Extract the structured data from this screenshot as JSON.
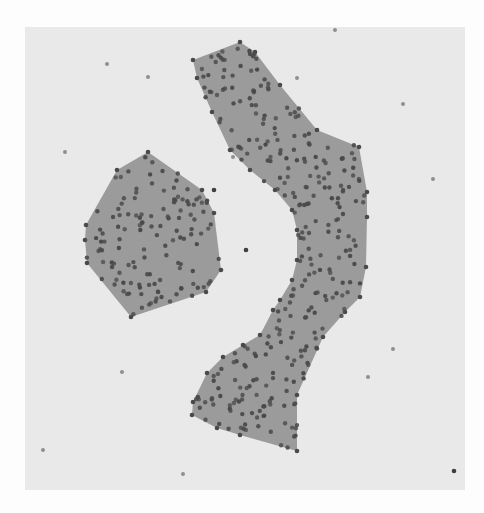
{
  "chart_data": {
    "type": "scatter",
    "title": "",
    "xlabel": "",
    "ylabel": "",
    "grid": false,
    "legend": null,
    "colors": {
      "panel_background": "#e9e9e9",
      "page_background": "#fdfdfd",
      "hull_fill": "#9b9b9b",
      "cluster_point": "#4a4a4a",
      "noise_point": "#8f8f8f",
      "dark_outlier": "#3f3f3f"
    },
    "clusters": [
      {
        "name": "cluster-1",
        "shape": "compact polygon (left)",
        "approx_point_count": 130,
        "hull": [
          [
            148,
            152
          ],
          [
            202,
            190
          ],
          [
            214,
            213
          ],
          [
            221,
            270
          ],
          [
            206,
            292
          ],
          [
            131,
            317
          ],
          [
            87,
            263
          ],
          [
            85,
            240
          ],
          [
            86,
            225
          ],
          [
            117,
            170
          ]
        ]
      },
      {
        "name": "cluster-2",
        "shape": "elongated crescent (right)",
        "approx_point_count": 300,
        "hull": [
          [
            193,
            60
          ],
          [
            240,
            42
          ],
          [
            255,
            52
          ],
          [
            280,
            85
          ],
          [
            317,
            130
          ],
          [
            359,
            147
          ],
          [
            367,
            192
          ],
          [
            367,
            217
          ],
          [
            366,
            267
          ],
          [
            360,
            297
          ],
          [
            345,
            312
          ],
          [
            323,
            337
          ],
          [
            297,
            395
          ],
          [
            297,
            451
          ],
          [
            240,
            435
          ],
          [
            217,
            428
          ],
          [
            192,
            415
          ],
          [
            193,
            402
          ],
          [
            207,
            373
          ],
          [
            223,
            357
          ],
          [
            243,
            345
          ],
          [
            260,
            335
          ],
          [
            273,
            310
          ],
          [
            280,
            300
          ],
          [
            292,
            280
          ],
          [
            297,
            260
          ],
          [
            297,
            230
          ],
          [
            292,
            210
          ],
          [
            275,
            190
          ],
          [
            250,
            170
          ],
          [
            230,
            150
          ],
          [
            212,
            112
          ],
          [
            197,
            78
          ]
        ]
      }
    ],
    "noise_points": [
      [
        107,
        64
      ],
      [
        148,
        77
      ],
      [
        65,
        152
      ],
      [
        335,
        30
      ],
      [
        297,
        78
      ],
      [
        233,
        157
      ],
      [
        246,
        250
      ],
      [
        122,
        372
      ],
      [
        43,
        450
      ],
      [
        183,
        474
      ],
      [
        403,
        104
      ],
      [
        433,
        179
      ],
      [
        393,
        349
      ],
      [
        368,
        377
      ]
    ],
    "dark_outliers": [
      [
        454,
        471
      ],
      [
        214,
        190
      ],
      [
        246,
        250
      ]
    ]
  }
}
